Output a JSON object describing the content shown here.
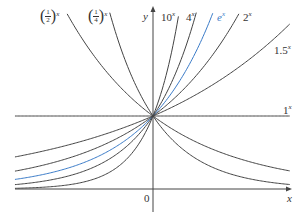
{
  "chart_data": {
    "type": "line",
    "title": "",
    "xlabel": "x",
    "ylabel": "y",
    "origin_label": "0",
    "xlim": [
      -2.03,
      2.01
    ],
    "ylim": [
      -0.44,
      2.41
    ],
    "grid": false,
    "legend_position": "inline labels",
    "series": [
      {
        "name": "(1/2)^x",
        "base": 0.5,
        "color": "#444444",
        "label_main": "1",
        "label_den": "2",
        "label_exp": "x"
      },
      {
        "name": "(1/4)^x",
        "base": 0.25,
        "color": "#444444",
        "label_main": "1",
        "label_den": "4",
        "label_exp": "x"
      },
      {
        "name": "10^x",
        "base": 10,
        "color": "#444444",
        "label_main": "10",
        "label_exp": "x"
      },
      {
        "name": "4^x",
        "base": 4,
        "color": "#444444",
        "label_main": "4",
        "label_exp": "x"
      },
      {
        "name": "e^x",
        "base": 2.71828,
        "color": "#3a7bc8",
        "label_main": "e",
        "label_exp": "x"
      },
      {
        "name": "2^x",
        "base": 2,
        "color": "#444444",
        "label_main": "2",
        "label_exp": "x"
      },
      {
        "name": "1.5^x",
        "base": 1.5,
        "color": "#444444",
        "label_main": "1.5",
        "label_exp": "x"
      },
      {
        "name": "1^x",
        "base": 1,
        "color": "#444444",
        "label_main": "1",
        "label_exp": "x"
      }
    ],
    "annotations": [
      "All curves pass through (0, 1)"
    ]
  },
  "labels": {
    "half": {
      "num": "1",
      "den": "2",
      "exp": "x"
    },
    "quarter": {
      "num": "1",
      "den": "4",
      "exp": "x"
    },
    "ten": {
      "base": "10",
      "exp": "x"
    },
    "four": {
      "base": "4",
      "exp": "x"
    },
    "e": {
      "base": "e",
      "exp": "x"
    },
    "two": {
      "base": "2",
      "exp": "x"
    },
    "onefive": {
      "base": "1.5",
      "exp": "x"
    },
    "one": {
      "base": "1",
      "exp": "x"
    },
    "x_axis": "x",
    "y_axis": "y",
    "origin": "0"
  }
}
